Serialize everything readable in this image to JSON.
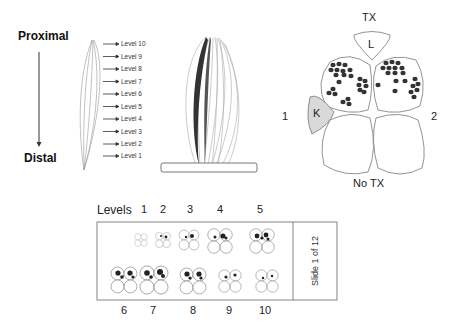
{
  "axis": {
    "top_label": "Proximal",
    "bottom_label": "Distal"
  },
  "spindle_levels": [
    {
      "label": "Level 10"
    },
    {
      "label": "Level 9"
    },
    {
      "label": "Level 8"
    },
    {
      "label": "Level 7"
    },
    {
      "label": "Level 6"
    },
    {
      "label": "Level 5"
    },
    {
      "label": "Level 4"
    },
    {
      "label": "Level 3"
    },
    {
      "label": "Level 2"
    },
    {
      "label": "Level 1"
    }
  ],
  "cross_section": {
    "top_label": "TX",
    "bottom_label": "No TX",
    "left_label": "1",
    "right_label": "2",
    "l_label": "L",
    "k_label": "K",
    "colors": {
      "outline": "#666666",
      "dots": "#333333",
      "k_fill": "#d9d9d9"
    }
  },
  "levels_panel": {
    "title": "Levels",
    "top_numbers": [
      "1",
      "2",
      "3",
      "4",
      "5"
    ],
    "bottom_numbers": [
      "6",
      "7",
      "8",
      "9",
      "10"
    ],
    "slide_label": "Slide 1 of 12"
  }
}
